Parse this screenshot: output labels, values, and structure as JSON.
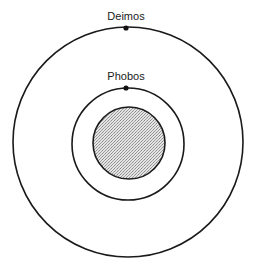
{
  "diagram": {
    "type": "orbit-diagram",
    "labels": {
      "outer_moon": "Deimos",
      "inner_moon": "Phobos"
    },
    "bodies": [
      {
        "name": "Mars",
        "role": "central-planet",
        "cx": 128,
        "cy": 143,
        "r": 36,
        "fill": "#c8c8c8",
        "pattern": "stipple"
      },
      {
        "name": "Phobos",
        "role": "inner-moon",
        "orbit_r": 56,
        "dot_x": 126,
        "dot_y": 88
      },
      {
        "name": "Deimos",
        "role": "outer-moon",
        "orbit_r": 115,
        "dot_x": 126,
        "dot_y": 28
      }
    ],
    "colors": {
      "stroke": "#1a1a1a",
      "planet_fill": "#c8c8c8",
      "background": "#ffffff"
    }
  }
}
